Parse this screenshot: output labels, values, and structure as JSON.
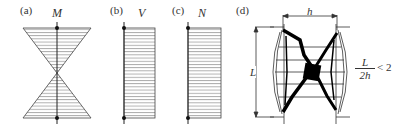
{
  "panels": [
    {
      "id": "a",
      "label": "(a)",
      "symbol": "M",
      "type": "bending-moment-diagram"
    },
    {
      "id": "b",
      "label": "(b)",
      "symbol": "V",
      "type": "shear-force-diagram"
    },
    {
      "id": "c",
      "label": "(c)",
      "symbol": "N",
      "type": "axial-force-diagram"
    },
    {
      "id": "d",
      "label": "(d)",
      "type": "crack-pattern",
      "width_label": "h",
      "height_label": "L",
      "ratio": {
        "numerator": "L",
        "denominator": "2h",
        "relation": "< 2"
      }
    }
  ]
}
